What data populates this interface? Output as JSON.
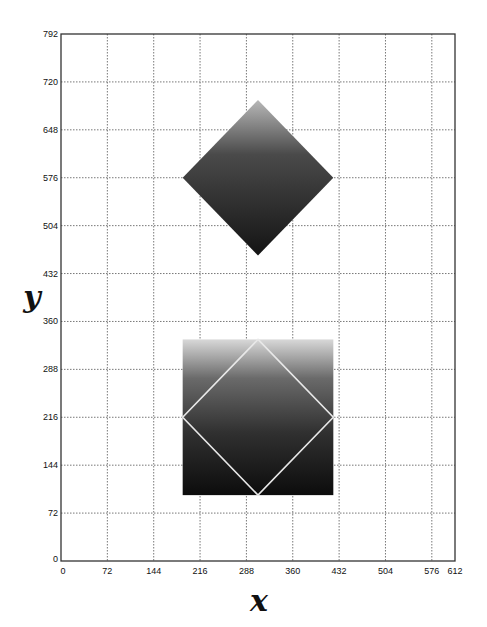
{
  "chart_data": {
    "type": "diagram-plot",
    "title": "",
    "xlabel": "x",
    "ylabel": "y",
    "xlim": [
      0,
      612
    ],
    "ylim": [
      0,
      792
    ],
    "grid": true,
    "grid_style": "dotted",
    "x_ticks": [
      0,
      72,
      144,
      216,
      288,
      360,
      432,
      504,
      576,
      612
    ],
    "y_ticks": [
      0,
      72,
      144,
      216,
      288,
      360,
      432,
      504,
      576,
      648,
      720,
      792
    ],
    "shapes": [
      {
        "name": "diamond",
        "kind": "polygon",
        "fill": "vertical-gradient",
        "gradient_top": "#b8b8b8",
        "gradient_bottom": "#141414",
        "points": [
          [
            306,
            693
          ],
          [
            423,
            576
          ],
          [
            306,
            459
          ],
          [
            189,
            576
          ]
        ]
      },
      {
        "name": "square",
        "kind": "rect",
        "fill": "vertical-gradient",
        "gradient_top": "#d8d8d8",
        "gradient_bottom": "#0c0c0c",
        "x0": 189,
        "y0": 99,
        "x1": 423,
        "y1": 333
      },
      {
        "name": "inscribed-diamond-outline",
        "kind": "polyline-closed",
        "stroke": "#e8e8e8",
        "points": [
          [
            306,
            333
          ],
          [
            423,
            216
          ],
          [
            306,
            99
          ],
          [
            189,
            216
          ]
        ]
      }
    ]
  },
  "plot": {
    "left": 61,
    "top": 34,
    "right": 455,
    "bottom": 561
  },
  "labels": {
    "x_axis": "x",
    "y_axis": "y"
  }
}
